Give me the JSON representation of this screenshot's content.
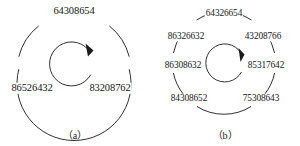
{
  "figure": {
    "background_color": "#ffffff",
    "stroke_color": "#1a1a1a",
    "panels": [
      {
        "id": "a",
        "caption": "（a）",
        "center_x": 74,
        "center_y": 63,
        "outer_radius": 57,
        "inner_radius": 22,
        "arrow_direction": "clockwise",
        "labels": [
          {
            "text": "64308654",
            "angle_deg": -90,
            "radius": 57,
            "pos_x": 74,
            "pos_y": 11
          },
          {
            "text": "86526432",
            "angle_deg": 180,
            "radius": 57,
            "pos_x": 32,
            "pos_y": 88
          },
          {
            "text": "83208762",
            "angle_deg": 0,
            "radius": 57,
            "pos_x": 110,
            "pos_y": 88
          }
        ]
      },
      {
        "id": "b",
        "caption": "（b）",
        "center_x": 224,
        "center_y": 63,
        "outer_radius": 51,
        "inner_radius": 19,
        "arrow_direction": "clockwise",
        "labels": [
          {
            "text": "64326654",
            "angle_deg": -90,
            "radius": 51,
            "pos_x": 224,
            "pos_y": 14
          },
          {
            "text": "86326632",
            "angle_deg": -145,
            "radius": 51,
            "pos_x": 186,
            "pos_y": 37
          },
          {
            "text": "43208766",
            "angle_deg": -35,
            "radius": 51,
            "pos_x": 263,
            "pos_y": 37
          },
          {
            "text": "86308632",
            "angle_deg": 180,
            "radius": 51,
            "pos_x": 183,
            "pos_y": 66
          },
          {
            "text": "85317642",
            "angle_deg": 0,
            "radius": 51,
            "pos_x": 266,
            "pos_y": 66
          },
          {
            "text": "84308652",
            "angle_deg": 143,
            "radius": 51,
            "pos_x": 189,
            "pos_y": 99
          },
          {
            "text": "75308643",
            "angle_deg": 37,
            "radius": 51,
            "pos_x": 261,
            "pos_y": 99
          }
        ]
      }
    ]
  }
}
